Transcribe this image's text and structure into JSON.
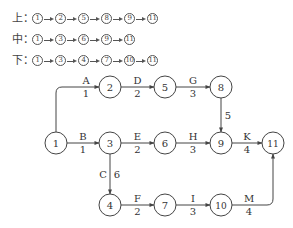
{
  "paths": [
    {
      "label": "上：",
      "nodes": [
        "1",
        "2",
        "5",
        "8",
        "9",
        "11"
      ]
    },
    {
      "label": "中：",
      "nodes": [
        "1",
        "3",
        "6",
        "9",
        "11"
      ]
    },
    {
      "label": "下：",
      "nodes": [
        "1",
        "3",
        "4",
        "7",
        "10",
        "11"
      ]
    }
  ],
  "network": {
    "nodes": [
      "1",
      "2",
      "3",
      "4",
      "5",
      "6",
      "7",
      "8",
      "9",
      "10",
      "11"
    ],
    "activities": [
      {
        "name": "A",
        "duration": "1",
        "from": "1",
        "to": "2"
      },
      {
        "name": "B",
        "duration": "1",
        "from": "1",
        "to": "3"
      },
      {
        "name": "C",
        "duration": "6",
        "from": "3",
        "to": "4"
      },
      {
        "name": "D",
        "duration": "2",
        "from": "2",
        "to": "5"
      },
      {
        "name": "E",
        "duration": "2",
        "from": "3",
        "to": "6"
      },
      {
        "name": "F",
        "duration": "2",
        "from": "4",
        "to": "7"
      },
      {
        "name": "G",
        "duration": "3",
        "from": "5",
        "to": "8"
      },
      {
        "name": "H",
        "duration": "3",
        "from": "6",
        "to": "9"
      },
      {
        "name": "I",
        "duration": "3",
        "from": "7",
        "to": "10"
      },
      {
        "name": "",
        "duration": "5",
        "from": "8",
        "to": "9"
      },
      {
        "name": "K",
        "duration": "4",
        "from": "9",
        "to": "11"
      },
      {
        "name": "M",
        "duration": "4",
        "from": "10",
        "to": "11"
      }
    ]
  }
}
